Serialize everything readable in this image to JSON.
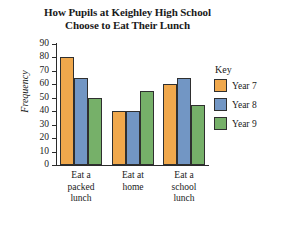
{
  "chart_data": {
    "type": "bar",
    "title": "How Pupils at Keighley High School Choose to Eat Their Lunch",
    "title_lines": [
      "How Pupils at Keighley High School",
      "Choose to Eat Their Lunch"
    ],
    "xlabel": "",
    "ylabel": "Frequency",
    "ylim": [
      0,
      90
    ],
    "ytick_step": 10,
    "yticks": [
      90,
      80,
      70,
      60,
      50,
      40,
      30,
      20,
      10,
      0
    ],
    "grid": false,
    "legend_title": "Key",
    "legend_position": "right",
    "categories": [
      "Eat a packed lunch",
      "Eat at home",
      "Eat a school lunch"
    ],
    "category_lines": [
      [
        "Eat a",
        "packed",
        "lunch"
      ],
      [
        "Eat at",
        "home"
      ],
      [
        "Eat a",
        "school",
        "lunch"
      ]
    ],
    "series": [
      {
        "name": "Year 7",
        "color": "#F0A84C",
        "values": [
          80,
          40,
          60
        ]
      },
      {
        "name": "Year 8",
        "color": "#7296C4",
        "values": [
          65,
          40,
          65
        ]
      },
      {
        "name": "Year 9",
        "color": "#76B069",
        "values": [
          50,
          55,
          45
        ]
      }
    ]
  }
}
